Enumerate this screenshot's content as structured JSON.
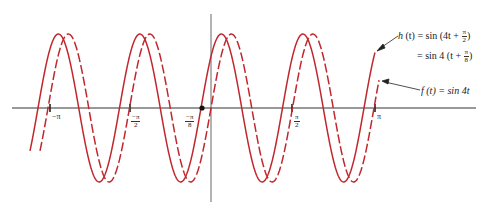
{
  "chart_data": {
    "type": "line",
    "title": "",
    "xlabel": "t",
    "ylabel": "",
    "xlim": [
      -3.35,
      4.9
    ],
    "ylim": [
      -1.2,
      1.2
    ],
    "grid": false,
    "x_ticks": [
      {
        "value": -3.1416,
        "label": "−π"
      },
      {
        "value": -1.5708,
        "label": "−π/2"
      },
      {
        "value": -0.3927,
        "label": "−π/8"
      },
      {
        "value": 1.5708,
        "label": "π/2"
      },
      {
        "value": 3.1416,
        "label": "π"
      }
    ],
    "marked_point": {
      "t": -0.3927,
      "y": 0,
      "label": "−π/8"
    },
    "series": [
      {
        "name": "h(t) = sin(4t + π/2) = sin 4(t + π/8)",
        "style": "solid",
        "color": "#c0282d",
        "formula": "sin(4t + pi/2)",
        "t_range": [
          -3.3,
          3.05
        ]
      },
      {
        "name": "f(t) = sin 4t",
        "style": "dashed",
        "color": "#c0282d",
        "formula": "sin(4t)",
        "t_range": [
          -3.3,
          3.15
        ]
      }
    ],
    "annotations": [
      {
        "text": "h (t) = sin (4t + π/2)",
        "points_to": "solid curve right end"
      },
      {
        "text": "= sin 4 (t + π/8)",
        "points_to": null
      },
      {
        "text": "f (t) = sin 4t",
        "points_to": "dashed curve right end"
      }
    ]
  },
  "labels": {
    "h_line1_prefix": "h",
    "h_line1_mid": " (t) = sin (4t + ",
    "h_line1_num": "π",
    "h_line1_den": "2",
    "h_line1_suffix": ")",
    "h_line2_prefix": "= sin 4 (t + ",
    "h_line2_num": "π",
    "h_line2_den": "8",
    "h_line2_suffix": ")",
    "f_text": "f (t) = sin 4t"
  },
  "ticks": {
    "neg_pi": "−π",
    "neg_pi_2_num": "−π",
    "neg_pi_2_den": "2",
    "neg_pi_8_num": "−π",
    "neg_pi_8_den": "8",
    "pi_2_num": "π",
    "pi_2_den": "2",
    "pi": "π"
  },
  "geometry": {
    "axis_y_px": 108,
    "origin_x_px": 210,
    "period_px": 81.5,
    "amplitude_px": 74,
    "solid_zero_up_x": 201,
    "dashed_zero_up_x": 211,
    "solid_start_x": 30,
    "solid_end_x": 375,
    "dashed_start_x": 40,
    "dashed_end_x": 379
  },
  "colors": {
    "curve": "#c0282d",
    "axis": "#333333",
    "text": "#222222"
  }
}
